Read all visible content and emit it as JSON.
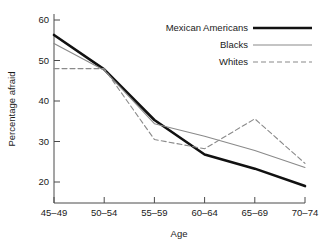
{
  "chart_data": {
    "type": "line",
    "title": "",
    "xlabel": "Age",
    "ylabel": "Percentage afraid",
    "categories": [
      "45-49",
      "50-54",
      "55-59",
      "60-64",
      "65-69",
      "70-74"
    ],
    "ylim": [
      15,
      62
    ],
    "yticks": [
      20,
      30,
      40,
      50,
      60
    ],
    "grid": false,
    "legend_position": "top-right",
    "series": [
      {
        "name": "Mexican Americans",
        "style": "solid-thick",
        "color": "#111111",
        "values": [
          56.3,
          47.8,
          35.3,
          26.8,
          23.3,
          19.0
        ]
      },
      {
        "name": "Blacks",
        "style": "solid-thin",
        "color": "#8a8a8a",
        "values": [
          54.2,
          47.6,
          34.4,
          31.3,
          27.8,
          23.6
        ]
      },
      {
        "name": "Whites",
        "style": "dashed",
        "color": "#8a8a8a",
        "values": [
          48.0,
          48.0,
          30.5,
          28.2,
          35.6,
          24.6
        ]
      }
    ]
  },
  "legend": {
    "items": [
      {
        "label": "Mexican Americans"
      },
      {
        "label": "Blacks"
      },
      {
        "label": "Whites"
      }
    ]
  },
  "axes": {
    "y_tick_labels": [
      "60",
      "50",
      "40",
      "30",
      "20"
    ],
    "x_tick_labels": [
      "45-49",
      "50-54",
      "55-59",
      "60-64",
      "65-69",
      "70-74"
    ],
    "y_axis_title": "Percentage afraid",
    "x_axis_title": "Age"
  }
}
